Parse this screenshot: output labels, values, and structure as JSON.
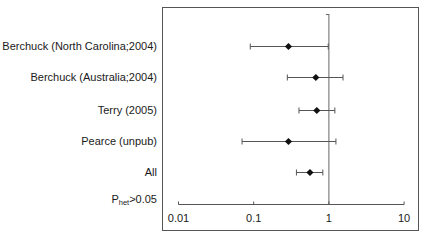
{
  "chart_data": {
    "type": "forest",
    "title": "",
    "xlabel": "",
    "ylabel": "",
    "xscale": "log",
    "xlim": [
      0.01,
      10
    ],
    "xticks": [
      0.01,
      0.1,
      1,
      10
    ],
    "xtick_labels": [
      "0.01",
      "0.1",
      "1",
      "10"
    ],
    "reference_line": 1,
    "grid": false,
    "legend": null,
    "studies": [
      {
        "label": "Berchuck (North Carolina;2004)",
        "estimate": 0.29,
        "ci_low": 0.09,
        "ci_high": 0.98
      },
      {
        "label": "Berchuck (Australia;2004)",
        "estimate": 0.67,
        "ci_low": 0.28,
        "ci_high": 1.54
      },
      {
        "label": "Terry (2005)",
        "estimate": 0.69,
        "ci_low": 0.4,
        "ci_high": 1.2
      },
      {
        "label": "Pearce (unpub)",
        "estimate": 0.29,
        "ci_low": 0.07,
        "ci_high": 1.24
      },
      {
        "label": "All",
        "estimate": 0.56,
        "ci_low": 0.37,
        "ci_high": 0.83
      }
    ],
    "annotation": {
      "prefix": "P",
      "subscript": "het",
      "suffix": ">0.05"
    }
  }
}
